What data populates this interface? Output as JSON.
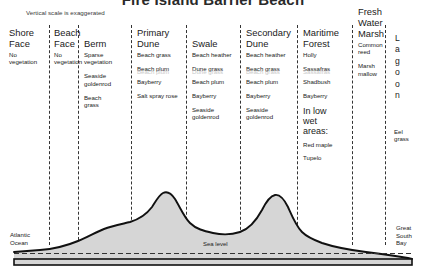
{
  "header": {
    "title": "Fire Island Barrier Beach",
    "note": "Vertical scale is exaggerated"
  },
  "zones": [
    {
      "id": "shore-face",
      "title": "Shore\nFace",
      "plants": [
        "No\nvegetation"
      ],
      "ghost": null
    },
    {
      "id": "beach-face",
      "title": "Beach\nFace",
      "plants": [
        "No\nvegetation"
      ],
      "ghost": null
    },
    {
      "id": "berm",
      "title": "Berm",
      "plants": [
        "Sparse\nvegetation",
        "Seaside\ngoldenrod",
        "Beach\ngrass"
      ],
      "ghost": null
    },
    {
      "id": "primary-dune",
      "title": "Primary\nDune",
      "plants": [
        "Beach grass",
        "Beach plum",
        "Bayberry",
        "Salt spray rose"
      ],
      "ghost": "Beach plum"
    },
    {
      "id": "swale",
      "title": "Swale",
      "plants": [
        "Beach heather",
        "Dune grass",
        "Beach plum",
        "Bayberry",
        "Seaside\ngoldenrod"
      ],
      "ghost": "Dune grass"
    },
    {
      "id": "secondary-dune",
      "title": "Secondary\nDune",
      "plants": [
        "Beach heather",
        "Beach grass",
        "Beach plum",
        "Bayberry",
        "Seaside\ngoldenrod"
      ],
      "ghost": "Beach grass"
    },
    {
      "id": "maritime-forest",
      "title": "Maritime\nForest",
      "plants": [
        "Holly",
        "Sassafras",
        "Shadbush",
        "Bayberry"
      ],
      "ghost": "Sassafras",
      "note": "In low\nwet\nareas:",
      "note_plants": [
        "Red maple",
        "Tupelo"
      ]
    },
    {
      "id": "fresh-water-marsh",
      "title": "Fresh\nWater\nMarsh",
      "plants": [
        "Common\nreed",
        "Marsh\nmallow"
      ],
      "ghost": null
    }
  ],
  "lagoon": {
    "id": "lagoon",
    "letters": [
      "L",
      "a",
      "g",
      "o",
      "o",
      "n"
    ],
    "plants": "Eel\ngrass"
  },
  "profile_labels": {
    "ocean": "Atlantic\nOcean",
    "bay": "Great\nSouth\nBay",
    "sea_level": "Sea level"
  },
  "colors": {
    "land_fill": "#d6d6d6",
    "outline": "#111111",
    "divider": "#333333",
    "ghost_text": "#c9c9c9"
  }
}
